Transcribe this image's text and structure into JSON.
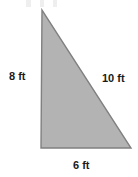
{
  "figure": {
    "type": "geometry-diagram",
    "shape": "right-triangle",
    "background_color": "#ffffff",
    "fill_color": "#b3b3b3",
    "stroke_color": "#808080",
    "label_color": "#1a1a1a",
    "width": 138,
    "height": 177
  },
  "triangle": {
    "vertices": {
      "apex": {
        "x": 42,
        "y": 10
      },
      "bottom_left": {
        "x": 41,
        "y": 148
      },
      "bottom_right": {
        "x": 131,
        "y": 148
      }
    },
    "points_attr": "42,10 41,148 131,148"
  },
  "labels": {
    "vertical_leg": "8 ft",
    "hypotenuse": "10 ft",
    "horizontal_leg": "6 ft"
  },
  "measurements": {
    "vertical_leg_value": 8,
    "hypotenuse_value": 10,
    "horizontal_leg_value": 6,
    "unit": "ft"
  }
}
